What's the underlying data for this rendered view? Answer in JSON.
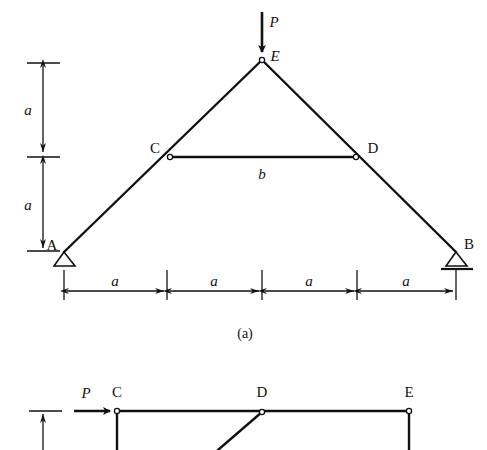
{
  "figure": {
    "title_captions": [
      {
        "id": "caption-a",
        "text": "(a)",
        "x": 245,
        "y": 334
      }
    ],
    "panel_a": {
      "name": "triangular-truss-diagram",
      "geometry": {
        "nodes": [
          {
            "id": "A",
            "label": "A",
            "x": 64,
            "y": 252,
            "label_x": 52,
            "label_y": 245,
            "support": "pin"
          },
          {
            "id": "B",
            "label": "B",
            "x": 456,
            "y": 252,
            "label_x": 469,
            "label_y": 244,
            "support": "roller"
          },
          {
            "id": "C",
            "label": "C",
            "x": 170,
            "y": 157,
            "label_x": 155,
            "label_y": 148,
            "support": "none"
          },
          {
            "id": "D",
            "label": "D",
            "x": 356,
            "y": 157,
            "label_x": 373,
            "label_y": 148,
            "support": "none"
          },
          {
            "id": "E",
            "label": "E",
            "x": 262,
            "y": 60,
            "label_x": 275,
            "label_y": 56,
            "support": "none"
          }
        ],
        "members": [
          {
            "id": "AE",
            "from": "A",
            "to": "E"
          },
          {
            "id": "EB",
            "from": "E",
            "to": "B"
          },
          {
            "id": "CD",
            "from": "C",
            "to": "D",
            "label": "b",
            "label_x": 262,
            "label_y": 174
          }
        ]
      },
      "load": {
        "label": "P",
        "label_x": 274,
        "label_y": 22,
        "arrow_x": 262,
        "arrow_y_start": 12,
        "arrow_y_end": 55,
        "direction": "down"
      },
      "vertical_dimensions": [
        {
          "label": "a",
          "label_x": 28,
          "label_y": 110,
          "line_x": 43,
          "y_top": 63,
          "y_bottom": 155
        },
        {
          "label": "a",
          "label_x": 28,
          "label_y": 205,
          "line_x": 43,
          "y_top": 159,
          "y_bottom": 251
        }
      ],
      "vertical_tick_marks": [
        {
          "y": 63,
          "x1": 27,
          "x2": 60
        },
        {
          "y": 157,
          "x1": 27,
          "x2": 60
        },
        {
          "y": 251,
          "x1": 27,
          "x2": 60
        }
      ],
      "horizontal_dimensions": [
        {
          "label": "a",
          "label_x": 115,
          "label_y": 281,
          "y": 291,
          "x_left": 64,
          "x_right": 167
        },
        {
          "label": "a",
          "label_x": 214,
          "label_y": 281,
          "y": 291,
          "x_left": 167,
          "x_right": 262
        },
        {
          "label": "a",
          "label_x": 309,
          "label_y": 281,
          "y": 291,
          "x_left": 262,
          "x_right": 357
        },
        {
          "label": "a",
          "label_x": 406,
          "label_y": 281,
          "y": 291,
          "x_left": 357,
          "x_right": 456
        }
      ],
      "horizontal_extension_ticks": [
        {
          "x": 64,
          "y1": 268,
          "y2": 300
        },
        {
          "x": 167,
          "y1": 268,
          "y2": 300
        },
        {
          "x": 262,
          "y1": 268,
          "y2": 300
        },
        {
          "x": 357,
          "y1": 268,
          "y2": 300
        },
        {
          "x": 456,
          "y1": 268,
          "y2": 300
        }
      ]
    },
    "panel_b": {
      "name": "frame-diagram-partial",
      "geometry": {
        "nodes": [
          {
            "id": "Cb",
            "label": "C",
            "x": 117,
            "y": 411,
            "label_x": 117,
            "label_y": 392
          },
          {
            "id": "Db",
            "label": "D",
            "x": 262,
            "y": 412,
            "label_x": 262,
            "label_y": 392
          },
          {
            "id": "Eb",
            "label": "E",
            "x": 409,
            "y": 411,
            "label_x": 409,
            "label_y": 392
          }
        ],
        "members": [
          {
            "id": "Cb-Eb-top",
            "x1": 117,
            "y1": 411,
            "x2": 409,
            "y2": 411
          },
          {
            "id": "Cb-down",
            "x1": 117,
            "y1": 411,
            "x2": 117,
            "y2": 450
          },
          {
            "id": "Eb-down",
            "x1": 409,
            "y1": 411,
            "x2": 409,
            "y2": 450
          },
          {
            "id": "Db-diag",
            "x1": 262,
            "y1": 412,
            "x2": 218,
            "y2": 450
          }
        ]
      },
      "load": {
        "label": "P",
        "label_x": 86,
        "label_y": 393,
        "arrow_x_start": 74,
        "arrow_x_end": 112,
        "arrow_y": 411,
        "direction": "right"
      },
      "vertical_dimension": {
        "line_x": 43,
        "y_top": 411,
        "y_bottom": 450,
        "tick": {
          "y": 411,
          "x1": 29,
          "x2": 62
        }
      }
    },
    "style": {
      "stroke_color": "#111111",
      "background_color": "#ffffff",
      "member_stroke_width": 2.4,
      "dimension_stroke_width": 1.2,
      "node_radius": 2.6
    }
  }
}
